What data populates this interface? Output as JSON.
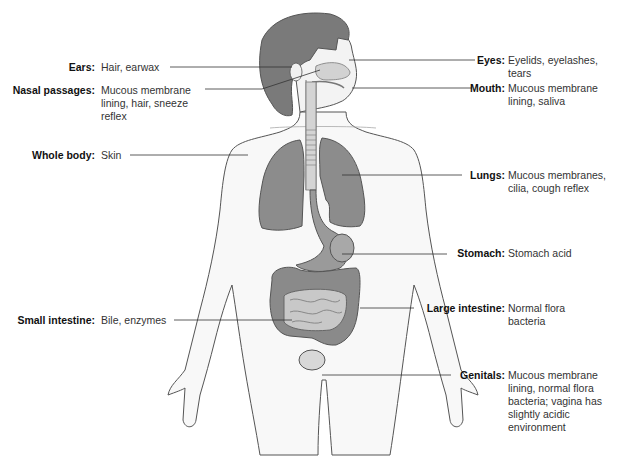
{
  "diagram": {
    "colors": {
      "organ": "#8c8c8c",
      "hair": "#7a7a7a",
      "skin_fill": "#f7f7f7",
      "outline": "#555555",
      "leader_line": "#333333"
    }
  },
  "labels_left": [
    {
      "term": "Ears:",
      "desc": "Hair, earwax"
    },
    {
      "term": "Nasal passages:",
      "desc": "Mucous membrane\nlining, hair, sneeze\nreflex"
    },
    {
      "term": "Whole body:",
      "desc": "Skin"
    },
    {
      "term": "Small intestine:",
      "desc": "Bile, enzymes"
    }
  ],
  "labels_right": [
    {
      "term": "Eyes:",
      "desc": "Eyelids, eyelashes,\ntears"
    },
    {
      "term": "Mouth:",
      "desc": "Mucous membrane\nlining, saliva"
    },
    {
      "term": "Lungs:",
      "desc": "Mucous membranes,\ncilia, cough reflex"
    },
    {
      "term": "Stomach:",
      "desc": "Stomach acid"
    },
    {
      "term": "Large intestine:",
      "desc": "Normal flora\nbacteria"
    },
    {
      "term": "Genitals:",
      "desc": "Mucous membrane\nlining, normal flora\nbacteria; vagina has\nslightly acidic\nenvironment"
    }
  ]
}
